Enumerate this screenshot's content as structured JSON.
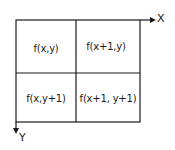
{
  "diagram": {
    "type": "pixel-neighborhood-grid",
    "axes": {
      "x_label": "X",
      "y_label": "Y"
    },
    "cells": [
      {
        "row": 0,
        "col": 0,
        "label": "f(x,y)"
      },
      {
        "row": 0,
        "col": 1,
        "label": "f(x+1,y)"
      },
      {
        "row": 1,
        "col": 0,
        "label": "f(x,y+1)"
      },
      {
        "row": 1,
        "col": 1,
        "label": "f(x+1, y+1)"
      }
    ],
    "colors": {
      "line": "#1a1a1a",
      "background": "#ffffff"
    }
  }
}
